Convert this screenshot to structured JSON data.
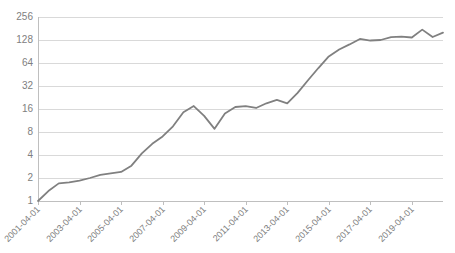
{
  "chart_data": {
    "type": "line",
    "title": "",
    "subtitle": "",
    "xlabel": "",
    "ylabel": "",
    "yscale": "log2",
    "ylim": [
      1,
      256
    ],
    "ytick_labels": [
      "256",
      "128",
      "64",
      "32",
      "16",
      "8",
      "4",
      "2",
      "1"
    ],
    "ytick_values": [
      256,
      128,
      64,
      32,
      16,
      8,
      4,
      2,
      1
    ],
    "xtick_labels": [
      "2001-04-01",
      "2003-04-01",
      "2005-04-01",
      "2007-04-01",
      "2009-04-01",
      "2011-04-01",
      "2013-04-01",
      "2015-04-01",
      "2017-04-01",
      "2019-04-01"
    ],
    "xlim": [
      "2001-04-01",
      "2020-10-01"
    ],
    "grid": "horizontal",
    "legend": "none",
    "line_color": "#808080",
    "grid_color": "#d9d9d9",
    "axis_color": "#bfbfbf",
    "label_color": "#808080",
    "series": [
      {
        "name": "value",
        "x": [
          "2001-04-01",
          "2001-10-01",
          "2002-04-01",
          "2002-10-01",
          "2003-04-01",
          "2003-10-01",
          "2004-04-01",
          "2004-10-01",
          "2005-04-01",
          "2005-10-01",
          "2006-04-01",
          "2006-10-01",
          "2007-04-01",
          "2007-10-01",
          "2008-04-01",
          "2008-10-01",
          "2009-04-01",
          "2009-10-01",
          "2010-04-01",
          "2010-10-01",
          "2011-04-01",
          "2011-10-01",
          "2012-04-01",
          "2012-10-01",
          "2013-04-01",
          "2013-10-01",
          "2014-04-01",
          "2014-10-01",
          "2015-04-01",
          "2015-10-01",
          "2016-04-01",
          "2016-10-01",
          "2017-04-01",
          "2017-10-01",
          "2018-04-01",
          "2018-10-01",
          "2019-04-01",
          "2019-10-01",
          "2020-04-01",
          "2020-10-01"
        ],
        "values": [
          1.0,
          1.35,
          1.7,
          1.75,
          1.85,
          2.0,
          2.2,
          2.3,
          2.4,
          2.9,
          4.2,
          5.6,
          7.0,
          9.5,
          14.5,
          17.5,
          13.0,
          8.8,
          14.0,
          17.0,
          17.5,
          16.5,
          19.0,
          21.0,
          19.0,
          26.0,
          38.0,
          55.0,
          78.0,
          96.0,
          112.0,
          132.0,
          126.0,
          128.0,
          140.0,
          142.0,
          138.0,
          175.0,
          140.0,
          160.0
        ]
      }
    ],
    "annotations": []
  }
}
